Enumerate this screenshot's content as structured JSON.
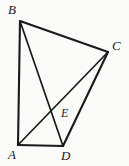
{
  "figure": {
    "background_color": "#fbfbfa",
    "stroke_color": "#1a1a1a",
    "label_color": "#1a1a1a",
    "width": 129,
    "height": 166,
    "points": {
      "A": {
        "label": "A",
        "x": 18,
        "y": 145
      },
      "B": {
        "label": "B",
        "x": 20,
        "y": 21
      },
      "C": {
        "label": "C",
        "x": 108,
        "y": 52
      },
      "D": {
        "label": "D",
        "x": 63,
        "y": 146
      },
      "E": {
        "label": "E",
        "x": 57,
        "y": 112
      }
    },
    "segments": [
      {
        "name": "segment-AB",
        "from": "A",
        "to": "B",
        "width": 2.1
      },
      {
        "name": "segment-BC",
        "from": "B",
        "to": "C",
        "width": 2.1
      },
      {
        "name": "segment-CD",
        "from": "C",
        "to": "D",
        "width": 2.1
      },
      {
        "name": "segment-AD",
        "from": "A",
        "to": "D",
        "width": 2.1
      },
      {
        "name": "diagonal-AC",
        "from": "A",
        "to": "C",
        "width": 1.7
      },
      {
        "name": "diagonal-BD",
        "from": "B",
        "to": "D",
        "width": 1.7
      }
    ],
    "intersection": {
      "name": "diagonal-intersection-E",
      "of": [
        "diagonal-AC",
        "diagonal-BD"
      ],
      "label": "E"
    }
  }
}
